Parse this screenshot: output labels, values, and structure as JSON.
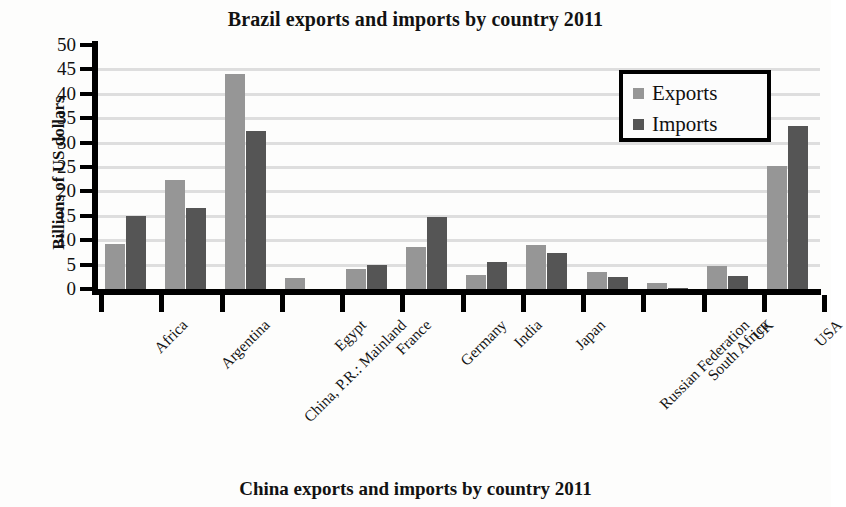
{
  "chart_data": {
    "type": "bar",
    "title": "Brazil exports and imports by country 2011",
    "xlabel": "",
    "ylabel": "Billions of US dollars",
    "ylim": [
      0,
      50
    ],
    "ytick_step": 5,
    "yticks": [
      "50",
      "45",
      "40",
      "35",
      "30",
      "25",
      "20",
      "15",
      "10",
      "5",
      "0"
    ],
    "grid": true,
    "legend_position": "top-right",
    "categories": [
      "Africa",
      "Argentina",
      "China, P.R.: Mainland",
      "Egypt",
      "France",
      "Germany",
      "India",
      "Japan",
      "Russian Federation",
      "South Africa",
      "UK",
      "USA"
    ],
    "series": [
      {
        "name": "Exports",
        "color": "#969696",
        "values": [
          9.3,
          22.3,
          44.1,
          2.2,
          4.1,
          8.6,
          2.8,
          9.1,
          3.5,
          1.2,
          4.7,
          25.3
        ]
      },
      {
        "name": "Imports",
        "color": "#555555",
        "values": [
          14.9,
          16.7,
          32.4,
          0.0,
          5.0,
          14.8,
          5.6,
          7.3,
          2.4,
          0.3,
          2.6,
          33.5
        ]
      }
    ]
  },
  "second_figure": {
    "title": "China exports and imports by country 2011"
  },
  "colors": {
    "exports": "#969696",
    "imports": "#555555",
    "axis": "#000000",
    "gridline": "#d8d8d8",
    "page": "#fdfdfc"
  }
}
